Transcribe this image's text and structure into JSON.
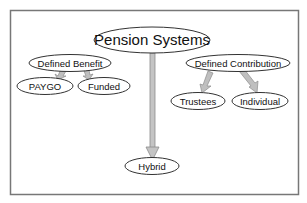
{
  "diagram": {
    "type": "hierarchy",
    "colors": {
      "background": "#ffffff",
      "frame": "#777777",
      "node_fill": "#ffffff",
      "node_stroke": "#333333",
      "arrow_fill": "#bfbfbf",
      "arrow_stroke": "#8c8c8c",
      "text": "#111111"
    },
    "nodes": {
      "root": {
        "label": "Pension Systems"
      },
      "defined_benefit": {
        "label": "Defined Benefit"
      },
      "paygo": {
        "label": "PAYGO"
      },
      "funded": {
        "label": "Funded"
      },
      "defined_contribution": {
        "label": "Defined Contribution"
      },
      "trustees": {
        "label": "Trustees"
      },
      "individual": {
        "label": "Individual"
      },
      "hybrid": {
        "label": "Hybrid"
      }
    },
    "edges": [
      {
        "from": "Pension Systems",
        "to": "Hybrid"
      },
      {
        "from": "Defined Benefit",
        "to": "PAYGO"
      },
      {
        "from": "Defined Benefit",
        "to": "Funded"
      },
      {
        "from": "Defined Contribution",
        "to": "Trustees"
      },
      {
        "from": "Defined Contribution",
        "to": "Individual"
      }
    ]
  }
}
